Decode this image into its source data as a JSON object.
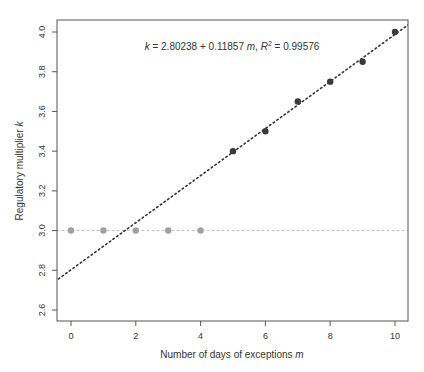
{
  "chart_data": {
    "type": "scatter",
    "title": "",
    "annotation": {
      "lhs": "k",
      "equation": " = 2.80238 + 0.11857 ",
      "var": "m",
      "sep": ",  ",
      "r2_label": "R",
      "r2_sup": "2",
      "r2_value": " = 0.99576"
    },
    "xlabel": "Number of days of exceptions",
    "xlabel_var": "m",
    "ylabel": "Regulatory multiplier",
    "ylabel_var": "k",
    "xlim": [
      -0.3,
      10.4
    ],
    "ylim": [
      2.55,
      4.05
    ],
    "x_ticks": [
      0,
      2,
      4,
      6,
      8,
      10
    ],
    "x_tick_labels": [
      "0",
      "2",
      "4",
      "6",
      "8",
      "10"
    ],
    "y_ticks": [
      2.6,
      2.8,
      3.0,
      3.2,
      3.4,
      3.6,
      3.8,
      4.0
    ],
    "y_tick_labels": [
      "2.6",
      "2.8",
      "3.0",
      "3.2",
      "3.4",
      "3.6",
      "3.8",
      "4.0"
    ],
    "grid": false,
    "series": [
      {
        "name": "Green zone (constant k)",
        "color": "#a0a0a0",
        "x": [
          0,
          1,
          2,
          3,
          4
        ],
        "y": [
          3.0,
          3.0,
          3.0,
          3.0,
          3.0
        ]
      },
      {
        "name": "Yellow/red zone",
        "color": "#3a3a3a",
        "x": [
          5,
          6,
          7,
          8,
          9,
          10
        ],
        "y": [
          3.4,
          3.5,
          3.65,
          3.75,
          3.85,
          4.0
        ]
      }
    ],
    "reference_lines": [
      {
        "name": "k = 3 baseline",
        "type": "horizontal",
        "y": 3.0,
        "style": "dotted",
        "color": "#bbbbbb"
      },
      {
        "name": "fitted line",
        "type": "linear",
        "intercept": 2.80238,
        "slope": 0.11857,
        "style": "dotted",
        "color": "#333333"
      }
    ]
  }
}
